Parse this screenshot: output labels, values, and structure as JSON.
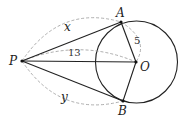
{
  "diagram": {
    "points": {
      "P": {
        "label": "P",
        "x": 22,
        "y": 61
      },
      "A": {
        "label": "A",
        "x": 121,
        "y": 22
      },
      "B": {
        "label": "B",
        "x": 123,
        "y": 101
      },
      "O": {
        "label": "O",
        "x": 136,
        "y": 62
      }
    },
    "circle": {
      "center": "O",
      "radius": 41
    },
    "measurements": {
      "PA": "x",
      "PB": "y",
      "PO": "13",
      "OA": "5"
    }
  }
}
